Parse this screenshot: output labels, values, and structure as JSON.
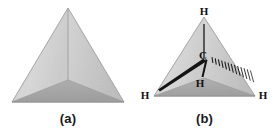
{
  "figure": {
    "kind": "chemistry-structure-diagram",
    "panels": [
      {
        "id": "a",
        "caption": "(a)",
        "description": "Plain shaded tetrahedron solid",
        "atom_labels": [],
        "bonds": []
      },
      {
        "id": "b",
        "caption": "(b)",
        "description": "Tetrahedron with inscribed methane molecule",
        "atom_labels": [
          {
            "text": "H",
            "position": "top-vertex"
          },
          {
            "text": "C",
            "position": "center"
          },
          {
            "text": "H",
            "position": "front-vertex"
          },
          {
            "text": "H",
            "position": "bottom-left-vertex"
          },
          {
            "text": "H",
            "position": "bottom-right-vertex"
          }
        ],
        "bonds": [
          {
            "from": "C",
            "to": "H-top",
            "style": "plain-line"
          },
          {
            "from": "C",
            "to": "H-bottom-left",
            "style": "solid-wedge"
          },
          {
            "from": "C",
            "to": "H-front",
            "style": "solid-wedge"
          },
          {
            "from": "C",
            "to": "H-bottom-right",
            "style": "hashed-wedge"
          }
        ]
      }
    ]
  },
  "colors": {
    "face_light": "#dcdcdc",
    "face_mid": "#c9c9c9",
    "face_dark": "#a9a9a9",
    "edge": "#9a9a9a",
    "ink": "#111111",
    "background": "#ffffff"
  }
}
